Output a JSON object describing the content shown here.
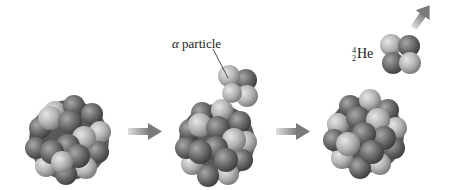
{
  "figure": {
    "labels": {
      "alpha_particle_greek": "α",
      "alpha_particle_text": " particle",
      "helium_mass_number": "4",
      "helium_atomic_number": "2",
      "helium_symbol": "He"
    },
    "stages": [
      {
        "name": "parent-nucleus",
        "description": "Nucleus before decay"
      },
      {
        "name": "nucleus-emitting-alpha",
        "description": "Nucleus with alpha particle emerging"
      },
      {
        "name": "daughter-nucleus",
        "description": "Nucleus after decay"
      }
    ],
    "colors": {
      "proton": "#b9b9b9",
      "neutron": "#6e6e6e",
      "arrow": "#8a8a8a",
      "background": "#ffffff"
    }
  }
}
